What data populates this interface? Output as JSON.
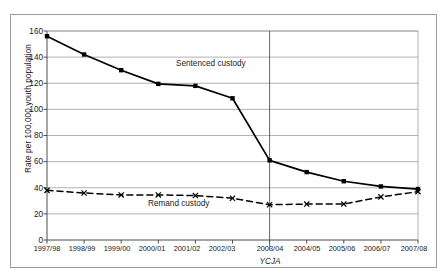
{
  "chart_data": {
    "type": "line",
    "title": "",
    "xlabel": "",
    "ylabel": "Rate per 100,000 youth population",
    "ylim": [
      0,
      160
    ],
    "ytick_values": [
      0,
      20,
      40,
      60,
      80,
      100,
      120,
      140,
      160
    ],
    "ytick_labels": [
      "0",
      "20",
      "40",
      "60",
      "80",
      "100",
      "120",
      "140",
      "160"
    ],
    "grid": true,
    "grid_axis": "y",
    "legend": "inline-annotations",
    "categories": [
      "1997/98",
      "1998/99",
      "1999/00",
      "2000/01",
      "2001/02",
      "2002/03",
      "2003/04",
      "2004/05",
      "2005/06",
      "2006/07",
      "2007/08"
    ],
    "series": [
      {
        "name": "Sentenced custody",
        "values": [
          156,
          142,
          130,
          119.5,
          118,
          108.5,
          61,
          52,
          45,
          41,
          39
        ],
        "style": "solid",
        "marker": "square",
        "color": "#000000"
      },
      {
        "name": "Remand custody",
        "values": [
          38,
          36,
          34.5,
          34.5,
          34,
          32,
          27,
          27.5,
          27.5,
          33,
          37
        ],
        "style": "dashed",
        "marker": "x",
        "color": "#000000"
      }
    ],
    "annotations": [
      {
        "text": "Sentenced custody",
        "x_category": "2001/02",
        "y_value": 126
      },
      {
        "text": "Remand custody",
        "x_category": "2002/03",
        "y_value": 24
      }
    ],
    "reference_lines": [
      {
        "label": "YCJA",
        "x_category": "2003/04",
        "orientation": "vertical",
        "color": "#555555"
      }
    ]
  },
  "colors": {
    "axis": "#4d4d4d",
    "grid": "#9f9f9f",
    "frame": "#9a9a9a",
    "series": "#000000",
    "reference_line": "#555555"
  }
}
